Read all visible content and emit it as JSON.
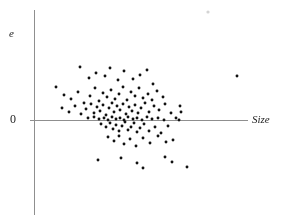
{
  "figure": {
    "background_color": "#ffffff",
    "axis_color": "#8f8f8f",
    "point_color": "#111111",
    "text_color": "#232323"
  },
  "labels": {
    "y_axis": "e",
    "origin": "0",
    "x_axis": "Size"
  },
  "chart_data": {
    "type": "scatter",
    "title": "",
    "xlabel": "Size",
    "ylabel": "e",
    "grid": false,
    "legend": null,
    "axes": {
      "origin_label": "0",
      "x_axis_pixel_y": 120,
      "y_axis_pixel_x": 34,
      "x_axis_pixel_range": [
        30,
        248
      ],
      "y_axis_pixel_range": [
        10,
        215
      ],
      "x_ticks": [],
      "y_ticks": [
        "0"
      ],
      "description": "Residual plot of regression residuals e against Size. Horizontal zero line drawn through the origin; no numeric scale is printed on either axis."
    },
    "n_points": 112,
    "pattern": "Residuals scattered randomly about zero with no systematic trend; spread is roughly constant, concentrated in a dense cluster at small-to-moderate Size values with a few isolated outliers to the right and at the extremes.",
    "points_pixels": [
      [
        56,
        87
      ],
      [
        80,
        67
      ],
      [
        89,
        78
      ],
      [
        96,
        73
      ],
      [
        105,
        76
      ],
      [
        110,
        68
      ],
      [
        118,
        80
      ],
      [
        124,
        71
      ],
      [
        133,
        79
      ],
      [
        140,
        75
      ],
      [
        147,
        70
      ],
      [
        153,
        84
      ],
      [
        64,
        95
      ],
      [
        71,
        99
      ],
      [
        78,
        92
      ],
      [
        84,
        103
      ],
      [
        90,
        96
      ],
      [
        95,
        88
      ],
      [
        99,
        101
      ],
      [
        103,
        93
      ],
      [
        107,
        97
      ],
      [
        111,
        90
      ],
      [
        115,
        99
      ],
      [
        119,
        94
      ],
      [
        123,
        87
      ],
      [
        127,
        100
      ],
      [
        131,
        92
      ],
      [
        135,
        96
      ],
      [
        139,
        88
      ],
      [
        143,
        98
      ],
      [
        148,
        94
      ],
      [
        152,
        100
      ],
      [
        157,
        91
      ],
      [
        163,
        97
      ],
      [
        62,
        108
      ],
      [
        69,
        112
      ],
      [
        75,
        106
      ],
      [
        81,
        114
      ],
      [
        86,
        109
      ],
      [
        91,
        104
      ],
      [
        94,
        113
      ],
      [
        97,
        107
      ],
      [
        100,
        111
      ],
      [
        103,
        105
      ],
      [
        106,
        115
      ],
      [
        109,
        108
      ],
      [
        112,
        103
      ],
      [
        114,
        112
      ],
      [
        117,
        106
      ],
      [
        120,
        110
      ],
      [
        123,
        104
      ],
      [
        126,
        114
      ],
      [
        129,
        107
      ],
      [
        132,
        111
      ],
      [
        135,
        105
      ],
      [
        138,
        113
      ],
      [
        141,
        108
      ],
      [
        145,
        103
      ],
      [
        149,
        112
      ],
      [
        154,
        106
      ],
      [
        159,
        110
      ],
      [
        165,
        104
      ],
      [
        171,
        113
      ],
      [
        88,
        118
      ],
      [
        94,
        117
      ],
      [
        99,
        119
      ],
      [
        104,
        118
      ],
      [
        108,
        120
      ],
      [
        112,
        117
      ],
      [
        116,
        119
      ],
      [
        120,
        118
      ],
      [
        124,
        120
      ],
      [
        128,
        117
      ],
      [
        133,
        119
      ],
      [
        137,
        118
      ],
      [
        142,
        120
      ],
      [
        147,
        117
      ],
      [
        152,
        119
      ],
      [
        158,
        118
      ],
      [
        164,
        120
      ],
      [
        176,
        118
      ],
      [
        101,
        124
      ],
      [
        106,
        127
      ],
      [
        110,
        123
      ],
      [
        113,
        129
      ],
      [
        116,
        125
      ],
      [
        119,
        131
      ],
      [
        122,
        126
      ],
      [
        125,
        122
      ],
      [
        128,
        130
      ],
      [
        131,
        127
      ],
      [
        134,
        123
      ],
      [
        137,
        132
      ],
      [
        140,
        128
      ],
      [
        144,
        124
      ],
      [
        149,
        131
      ],
      [
        155,
        127
      ],
      [
        161,
        133
      ],
      [
        168,
        126
      ],
      [
        108,
        137
      ],
      [
        114,
        141
      ],
      [
        119,
        136
      ],
      [
        124,
        144
      ],
      [
        130,
        139
      ],
      [
        136,
        146
      ],
      [
        143,
        138
      ],
      [
        150,
        143
      ],
      [
        158,
        136
      ],
      [
        166,
        142
      ],
      [
        173,
        140
      ],
      [
        98,
        160
      ],
      [
        121,
        158
      ],
      [
        137,
        163
      ],
      [
        143,
        168
      ],
      [
        165,
        157
      ],
      [
        172,
        162
      ],
      [
        187,
        167
      ],
      [
        237,
        76
      ],
      [
        179,
        120
      ],
      [
        180,
        106
      ],
      [
        181,
        112
      ]
    ],
    "outliers_pixels": [
      [
        237,
        76
      ],
      [
        187,
        167
      ],
      [
        56,
        87
      ]
    ],
    "faint_mark_pixels": [
      208,
      12
    ]
  }
}
